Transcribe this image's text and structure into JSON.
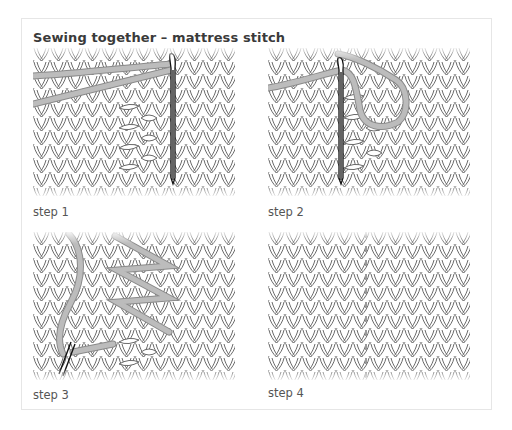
{
  "title": "Sewing together – mattress stitch",
  "colors": {
    "stitch_outline": "#6a6a6a",
    "yarn": "#b8b8b8",
    "yarn_outline": "#8a8a8a",
    "needle": "#111111",
    "card_border": "#e6e6e6"
  },
  "panels": [
    {
      "caption": "step 1",
      "icon": "mattress-stitch-step1-illustration"
    },
    {
      "caption": "step 2",
      "icon": "mattress-stitch-step2-illustration"
    },
    {
      "caption": "step 3",
      "icon": "mattress-stitch-step3-illustration"
    },
    {
      "caption": "step 4",
      "icon": "mattress-stitch-step4-illustration"
    }
  ]
}
